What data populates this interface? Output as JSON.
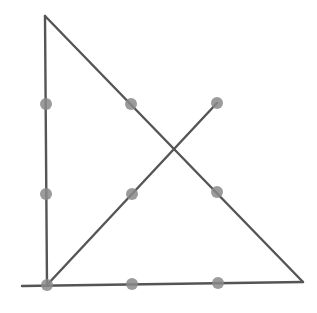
{
  "diagram": {
    "line_color": "#555555",
    "dot_color": "#8a8a8a",
    "dots": [
      {
        "row": 0,
        "col": 0,
        "x": 46,
        "y": 104
      },
      {
        "row": 0,
        "col": 1,
        "x": 131,
        "y": 104
      },
      {
        "row": 0,
        "col": 2,
        "x": 217,
        "y": 103
      },
      {
        "row": 1,
        "col": 0,
        "x": 46,
        "y": 194
      },
      {
        "row": 1,
        "col": 1,
        "x": 132,
        "y": 194
      },
      {
        "row": 1,
        "col": 2,
        "x": 217,
        "y": 192
      },
      {
        "row": 2,
        "col": 0,
        "x": 47,
        "y": 285
      },
      {
        "row": 2,
        "col": 1,
        "x": 132,
        "y": 284
      },
      {
        "row": 2,
        "col": 2,
        "x": 218,
        "y": 283
      }
    ],
    "lines": [
      {
        "name": "left-vertical-line",
        "x1": 45,
        "y1": 16,
        "x2": 47,
        "y2": 286
      },
      {
        "name": "hypotenuse-line",
        "x1": 45,
        "y1": 16,
        "x2": 303,
        "y2": 282
      },
      {
        "name": "baseline-line",
        "x1": 22,
        "y1": 286,
        "x2": 303,
        "y2": 282
      },
      {
        "name": "diagonal-line",
        "x1": 47,
        "y1": 285,
        "x2": 217,
        "y2": 103
      }
    ]
  }
}
